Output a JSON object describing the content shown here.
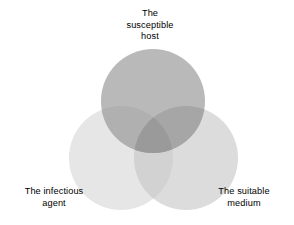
{
  "diagram": {
    "type": "venn-3-circle",
    "background_color": "#ffffff",
    "text_color": "#000000",
    "canvas": {
      "width": 294,
      "height": 225
    },
    "circles": [
      {
        "id": "susceptible-host",
        "label": "The\nsusceptible\nhost",
        "label_lines": [
          "The",
          "susceptible",
          "host"
        ],
        "cx": 153,
        "cy": 101,
        "r": 52,
        "fill": "#b9b9b9",
        "position": "top"
      },
      {
        "id": "infectious-agent",
        "label": "The infectious\nagent",
        "label_lines": [
          "The infectious",
          "agent"
        ],
        "cx": 121,
        "cy": 158,
        "r": 52,
        "fill": "#e6e6e6",
        "position": "bottom-left"
      },
      {
        "id": "suitable-medium",
        "label": "The suitable\nmedium",
        "label_lines": [
          "The suitable",
          "medium"
        ],
        "cx": 186,
        "cy": 158,
        "r": 52,
        "fill": "#dcdcdc",
        "position": "bottom-right"
      }
    ],
    "overlap_colors": {
      "host_agent": "#b0b0b0",
      "host_medium": "#a6a6a6",
      "agent_medium": "#d2d2d2",
      "all_three": "#9a9a9a"
    }
  },
  "labels": {
    "host": "The\nsusceptible\nhost",
    "agent": "The infectious\nagent",
    "medium": "The suitable\nmedium"
  }
}
